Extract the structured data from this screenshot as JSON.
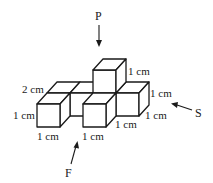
{
  "figure": {
    "views": {
      "top": "P",
      "front": "F",
      "side": "S"
    },
    "dimension_labels": {
      "top_cube_height": "1 cm",
      "back_depth": "2 cm",
      "left_height": "1 cm",
      "left_width": "1 cm",
      "front_middle_width": "1 cm",
      "right_front_width": "1 cm",
      "right_height": "1 cm",
      "right_depth": "1 cm"
    },
    "colors": {
      "line": "#1a1a1a",
      "background": "#ffffff"
    }
  }
}
